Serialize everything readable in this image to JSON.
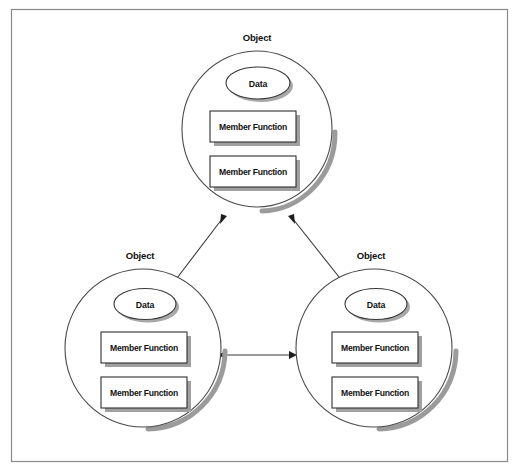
{
  "diagram": {
    "title_text_visible": false,
    "frame": {
      "name": "figure-border"
    },
    "colors": {
      "background": "#ffffff",
      "frame_stroke": "#8a8a8a",
      "circle_stroke": "#4a4a4a",
      "circle_shadow": "#9b9b9b",
      "shape_shadow": "#a0a0a0",
      "box_stroke": "#2e2e2e",
      "connector": "#3b3b3b",
      "text": "#111111"
    },
    "objects": [
      {
        "id": "object-top",
        "label": "Object",
        "data_label": "Data",
        "members": [
          "Member Function",
          "Member Function"
        ]
      },
      {
        "id": "object-bottom-left",
        "label": "Object",
        "data_label": "Data",
        "members": [
          "Member Function",
          "Member Function"
        ]
      },
      {
        "id": "object-bottom-right",
        "label": "Object",
        "data_label": "Data",
        "members": [
          "Member Function",
          "Member Function"
        ]
      }
    ],
    "connections": [
      {
        "id": "connector-top-left",
        "from": "object-top",
        "to": "object-bottom-left",
        "style": "double-arrow"
      },
      {
        "id": "connector-top-right",
        "from": "object-top",
        "to": "object-bottom-right",
        "style": "double-arrow"
      },
      {
        "id": "connector-bottom",
        "from": "object-bottom-left",
        "to": "object-bottom-right",
        "style": "double-arrow"
      }
    ]
  }
}
